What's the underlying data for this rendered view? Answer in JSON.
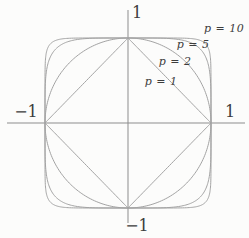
{
  "figure": {
    "width": 249,
    "height": 238,
    "colors": {
      "background": "#fcfcfb",
      "axis": "#8d8d8d",
      "curve": "#a3a3a3",
      "label": "#3d3d3d"
    },
    "center": {
      "x": 128,
      "y": 123
    },
    "radius": {
      "x": 83,
      "y": 85
    },
    "axes": {
      "x_axis": {
        "x1": 7,
        "y1": 123,
        "x2": 245,
        "y2": 123
      },
      "y_axis": {
        "x1": 128,
        "y1": 10,
        "x2": 128,
        "y2": 223
      }
    },
    "axis_labels": {
      "y_pos": {
        "text": "1",
        "x": 137,
        "y": 13
      },
      "x_neg": {
        "text": "−1",
        "x": 26,
        "y": 112
      },
      "x_pos": {
        "text": "1",
        "x": 230,
        "y": 112
      },
      "y_neg": {
        "text": "−1",
        "x": 137,
        "y": 226
      }
    },
    "curves": [
      {
        "p": 1,
        "label": {
          "text": "p = 1",
          "x": 161,
          "y": 81
        }
      },
      {
        "p": 2,
        "label": {
          "text": "p = 2",
          "x": 175,
          "y": 61
        }
      },
      {
        "p": 5,
        "label": {
          "text": "p = 5",
          "x": 193,
          "y": 44
        }
      },
      {
        "p": 10,
        "label": {
          "text": "p = 10",
          "x": 224,
          "y": 28
        }
      }
    ]
  }
}
